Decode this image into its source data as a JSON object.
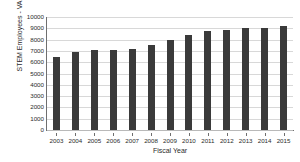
{
  "chart_data": {
    "type": "bar",
    "title": "",
    "xlabel": "Fiscal Year",
    "ylabel": "STEM Employees - VA",
    "categories": [
      "2003",
      "2004",
      "2005",
      "2006",
      "2007",
      "2008",
      "2009",
      "2010",
      "2011",
      "2012",
      "2013",
      "2014",
      "2015"
    ],
    "values": [
      6450,
      6880,
      7060,
      7080,
      7200,
      7560,
      7980,
      8370,
      8800,
      8880,
      9060,
      9040,
      9220
    ],
    "ylim": [
      0,
      10000
    ],
    "ytick_values": [
      0,
      1000,
      2000,
      3000,
      4000,
      5000,
      6000,
      7000,
      8000,
      9000,
      10000
    ],
    "ytick_labels": [
      "0",
      "1000",
      "2000",
      "3000",
      "4000",
      "5000",
      "6000",
      "7000",
      "8000",
      "9000",
      "10000"
    ],
    "grid": true,
    "grid_axis": "y",
    "legend": false,
    "legend_position": "none",
    "bar_color": "#3a3a3a",
    "grid_color": "#d8d8d8",
    "axis_color": "#6f6f6f",
    "background_color": "#ffffff"
  }
}
